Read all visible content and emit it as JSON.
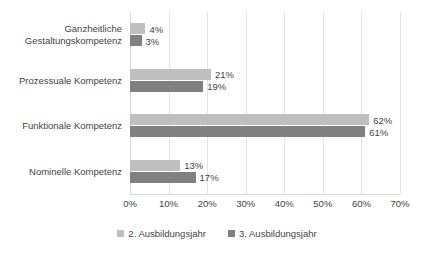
{
  "chart_data": {
    "type": "bar",
    "orientation": "horizontal",
    "title": "",
    "xlabel": "",
    "ylabel": "",
    "xlim": [
      0,
      70
    ],
    "xtick_labels": [
      "0%",
      "10%",
      "20%",
      "30%",
      "40%",
      "50%",
      "60%",
      "70%"
    ],
    "xticks": [
      0,
      10,
      20,
      30,
      40,
      50,
      60,
      70
    ],
    "grid": true,
    "legend_position": "bottom-center",
    "categories": [
      "Ganzheitliche Gestaltungskompetenz",
      "Prozessuale Kompetenz",
      "Funktionale Kompetenz",
      "Nominelle Kompetenz"
    ],
    "category_lines": [
      [
        "Ganzheitliche",
        "Gestaltungskompetenz"
      ],
      [
        "Prozessuale Kompetenz"
      ],
      [
        "Funktionale Kompetenz"
      ],
      [
        "Nominelle Kompetenz"
      ]
    ],
    "series": [
      {
        "name": "2. Ausbildungsjahr",
        "color": "#bfbfbf",
        "values": [
          4,
          21,
          62,
          13
        ],
        "value_labels": [
          "4%",
          "21%",
          "62%",
          "13%"
        ]
      },
      {
        "name": "3. Ausbildungsjahr",
        "color": "#808080",
        "values": [
          3,
          19,
          61,
          17
        ],
        "value_labels": [
          "3%",
          "19%",
          "61%",
          "17%"
        ]
      }
    ]
  },
  "legend": {
    "items": [
      {
        "label": "2. Ausbildungsjahr",
        "color": "#bfbfbf"
      },
      {
        "label": "3. Ausbildungsjahr",
        "color": "#808080"
      }
    ]
  },
  "colors": {
    "series_1": "#bfbfbf",
    "series_2": "#808080",
    "gridline": "#e3e3e3",
    "text": "#3f3f3f",
    "background": "#ffffff"
  }
}
